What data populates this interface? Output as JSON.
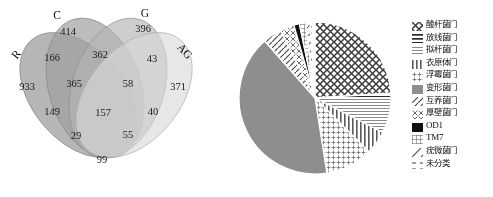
{
  "figure": {
    "panels": [
      "venn-diagram",
      "pie-chart-with-legend"
    ]
  },
  "venn": {
    "type": "venn4",
    "set_labels": [
      "R",
      "C",
      "G",
      "AG"
    ],
    "regions": [
      {
        "id": "C_only",
        "label": "414",
        "x": 68,
        "y": 33
      },
      {
        "id": "G_only",
        "label": "396",
        "x": 143,
        "y": 30
      },
      {
        "id": "R_C",
        "label": "166",
        "x": 52,
        "y": 59
      },
      {
        "id": "C_G",
        "label": "362",
        "x": 100,
        "y": 56
      },
      {
        "id": "G_AG",
        "label": "43",
        "x": 152,
        "y": 60
      },
      {
        "id": "R_only",
        "label": "933",
        "x": 27,
        "y": 88
      },
      {
        "id": "R_C_G",
        "label": "365",
        "x": 74,
        "y": 85
      },
      {
        "id": "C_G_AG",
        "label": "58",
        "x": 128,
        "y": 85
      },
      {
        "id": "AG_only",
        "label": "371",
        "x": 178,
        "y": 88
      },
      {
        "id": "R_C_lower",
        "label": "149",
        "x": 52,
        "y": 113
      },
      {
        "id": "R_C_G_AG",
        "label": "157",
        "x": 103,
        "y": 114
      },
      {
        "id": "G_AG_lower",
        "label": "40",
        "x": 153,
        "y": 113
      },
      {
        "id": "R_G",
        "label": "29",
        "x": 76,
        "y": 137
      },
      {
        "id": "C_AG",
        "label": "55",
        "x": 128,
        "y": 136
      },
      {
        "id": "G_bottom_only",
        "label": "99",
        "x": 102,
        "y": 161
      }
    ],
    "set_label_positions": [
      {
        "label": "R",
        "x": 17,
        "y": 55,
        "rotate": -52
      },
      {
        "label": "C",
        "x": 57,
        "y": 16,
        "rotate": 0
      },
      {
        "label": "G",
        "x": 145,
        "y": 14,
        "rotate": 0
      },
      {
        "label": "AG",
        "x": 184,
        "y": 52,
        "rotate": 47
      }
    ]
  },
  "chart_data": {
    "type": "pie",
    "title": "",
    "legend_position": "right",
    "center": {
      "x": 79,
      "y": 98
    },
    "radius": 76,
    "start_angle_deg": -90,
    "slices": [
      {
        "name": "酸杆菌门",
        "pattern": "crosshatch-grid",
        "value": 24.0,
        "color": "#f2f2f2"
      },
      {
        "name": "放线菌门",
        "pattern": "horizontal-lines",
        "value": 1.0,
        "color": "#ffffff"
      },
      {
        "name": "拟杆菌门",
        "pattern": "dense-horizontal",
        "value": 7.5,
        "color": "#fafafa"
      },
      {
        "name": "衣原体门",
        "pattern": "vertical-lines",
        "value": 5.0,
        "color": "#fbfbfb"
      },
      {
        "name": "浮霉菌门",
        "pattern": "small-crosses",
        "value": 10.0,
        "color": "#f6f6f6"
      },
      {
        "name": "变形菌门",
        "pattern": "solid-gray",
        "value": 41.0,
        "color": "#8e8e8e"
      },
      {
        "name": "互养菌门",
        "pattern": "diagonal-lines",
        "value": 4.0,
        "color": "#fcfcfc"
      },
      {
        "name": "厚壁菌门",
        "pattern": "x-crosses",
        "value": 3.0,
        "color": "#f9f9f9"
      },
      {
        "name": "OD1",
        "pattern": "solid-black",
        "value": 1.2,
        "color": "#111111"
      },
      {
        "name": "TM7",
        "pattern": "fine-grid",
        "value": 1.3,
        "color": "#f0f0f0"
      },
      {
        "name": "疣微菌门",
        "pattern": "sparse-diagonal",
        "value": 1.0,
        "color": "#fdfdfd"
      },
      {
        "name": "未分类",
        "pattern": "dashed-lines",
        "value": 1.0,
        "color": "#fdfdfd"
      }
    ]
  },
  "legend": {
    "items": [
      {
        "label": "酸杆菌门",
        "pattern": "crosshatch-grid",
        "latin": false
      },
      {
        "label": "放线菌门",
        "pattern": "horizontal-lines",
        "latin": false
      },
      {
        "label": "拟杆菌门",
        "pattern": "dense-horizontal",
        "latin": false
      },
      {
        "label": "衣原体门",
        "pattern": "vertical-lines",
        "latin": false
      },
      {
        "label": "浮霉菌门",
        "pattern": "small-crosses",
        "latin": false
      },
      {
        "label": "变形菌门",
        "pattern": "solid-gray",
        "latin": false
      },
      {
        "label": "互养菌门",
        "pattern": "diagonal-lines",
        "latin": false
      },
      {
        "label": "厚壁菌门",
        "pattern": "x-crosses",
        "latin": false
      },
      {
        "label": "OD1",
        "pattern": "solid-black",
        "latin": true
      },
      {
        "label": "TM7",
        "pattern": "fine-grid",
        "latin": true
      },
      {
        "label": "疣微菌门",
        "pattern": "sparse-diagonal",
        "latin": false
      },
      {
        "label": "未分类",
        "pattern": "dashed-lines",
        "latin": false
      }
    ]
  }
}
